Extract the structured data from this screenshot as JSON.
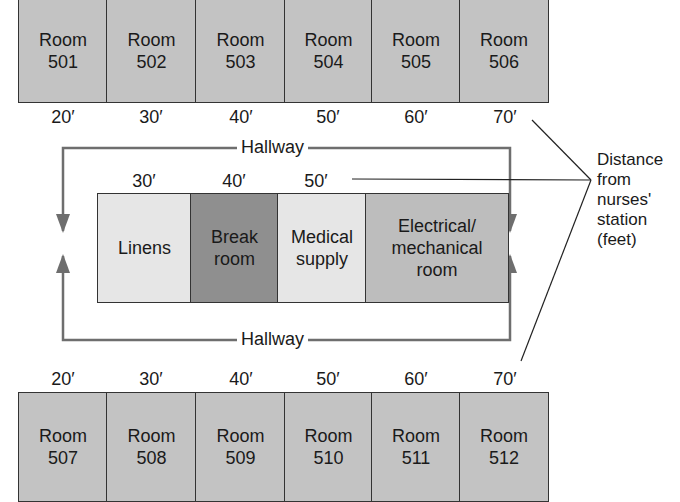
{
  "colors": {
    "room_fill": "#c3c3c3",
    "linens_fill": "#e6e6e6",
    "break_room_fill": "#8f8f8f",
    "medical_supply_fill": "#e6e6e6",
    "electrical_fill": "#bdbdbd",
    "hallway_line": "#6e6e6e",
    "outline": "#333333"
  },
  "top_rooms": [
    {
      "label": "Room",
      "number": "501",
      "distance": "20′"
    },
    {
      "label": "Room",
      "number": "502",
      "distance": "30′"
    },
    {
      "label": "Room",
      "number": "503",
      "distance": "40′"
    },
    {
      "label": "Room",
      "number": "504",
      "distance": "50′"
    },
    {
      "label": "Room",
      "number": "505",
      "distance": "60′"
    },
    {
      "label": "Room",
      "number": "506",
      "distance": "70′"
    }
  ],
  "bottom_rooms": [
    {
      "label": "Room",
      "number": "507",
      "distance": "20′"
    },
    {
      "label": "Room",
      "number": "508",
      "distance": "30′"
    },
    {
      "label": "Room",
      "number": "509",
      "distance": "40′"
    },
    {
      "label": "Room",
      "number": "510",
      "distance": "50′"
    },
    {
      "label": "Room",
      "number": "511",
      "distance": "60′"
    },
    {
      "label": "Room",
      "number": "512",
      "distance": "70′"
    }
  ],
  "center_block": [
    {
      "line1": "Linens",
      "line2": "",
      "line3": "",
      "distance": "30′"
    },
    {
      "line1": "Break",
      "line2": "room",
      "line3": "",
      "distance": "40′"
    },
    {
      "line1": "Medical",
      "line2": "supply",
      "line3": "",
      "distance": "50′"
    },
    {
      "line1": "Electrical/",
      "line2": "mechanical",
      "line3": "room",
      "distance": ""
    }
  ],
  "hallway": {
    "top_label": "Hallway",
    "bottom_label": "Hallway"
  },
  "legend": {
    "lines": [
      "Distance",
      "from",
      "nurses'",
      "station",
      "(feet)"
    ]
  }
}
